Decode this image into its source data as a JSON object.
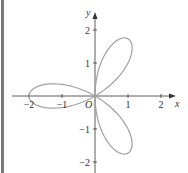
{
  "chart_data": {
    "type": "line",
    "subtype": "polar-rose",
    "title": "",
    "equation": "r = -2cos(3θ)",
    "xlabel": "x",
    "ylabel": "y",
    "origin_label": "O",
    "xlim": [
      -2.4,
      2.4
    ],
    "ylim": [
      -2.2,
      2.4
    ],
    "x_ticks": [
      -2,
      -1,
      1,
      2
    ],
    "y_ticks": [
      2,
      1,
      -1,
      -2
    ],
    "x_tick_labels": [
      "−2",
      "−1",
      "1",
      "2"
    ],
    "y_tick_labels": [
      "2",
      "1",
      "−1",
      "−2"
    ],
    "petals": [
      {
        "angle_deg": 60,
        "tip": [
          1.0,
          1.73
        ]
      },
      {
        "angle_deg": 180,
        "tip": [
          -2.0,
          0.0
        ]
      },
      {
        "angle_deg": 300,
        "tip": [
          1.0,
          -1.73
        ]
      }
    ],
    "grid": false,
    "legend": null,
    "curve_color": "#a0a0a0",
    "axis_color": "#333333"
  },
  "frame": {
    "left_bar_color": "#7a7a7a"
  }
}
